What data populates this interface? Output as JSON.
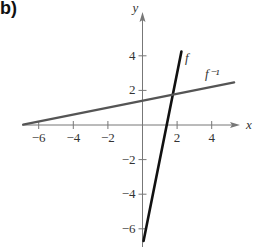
{
  "panel_label": "b)",
  "chart_data": {
    "type": "line",
    "title": "",
    "xlabel": "x",
    "ylabel": "y",
    "xlim": [
      -7,
      5.6
    ],
    "ylim": [
      -7.1,
      5.5
    ],
    "grid": false,
    "x_ticks": [
      -6,
      -4,
      -2,
      2,
      4
    ],
    "y_ticks": [
      -6,
      -4,
      -2,
      2,
      4
    ],
    "x_tick_labels": [
      "−6",
      "−4",
      "−2",
      "2",
      "4"
    ],
    "y_tick_labels": [
      "−6",
      "−4",
      "−2",
      "2",
      "4"
    ],
    "series": [
      {
        "name": "f",
        "label": "f",
        "equation": "f(x) = 5x − 7",
        "color": "#111111",
        "x": [
          0.06,
          2.25
        ],
        "y": [
          -6.7,
          4.25
        ]
      },
      {
        "name": "f_inverse",
        "label": "f⁻¹",
        "equation": "f⁻¹(x) = (x + 7)/5",
        "color": "#555555",
        "x": [
          -6.9,
          5.3
        ],
        "y": [
          0.02,
          2.46
        ]
      }
    ],
    "intersection": {
      "x": 1.75,
      "y": 1.75
    }
  }
}
